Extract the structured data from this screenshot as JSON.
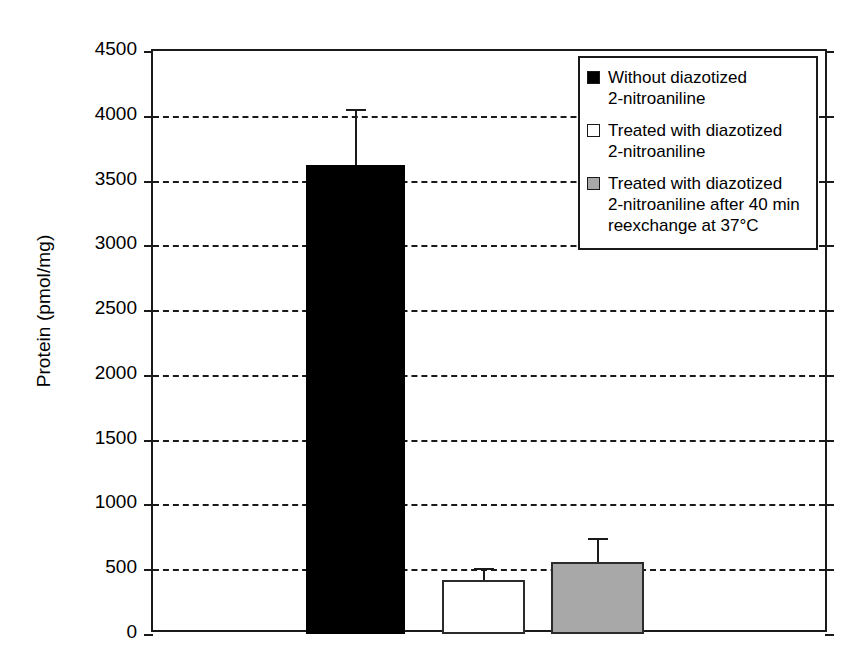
{
  "chart_data": {
    "type": "bar",
    "title": "",
    "xlabel": "",
    "ylabel": "Protein (pmol/mg)",
    "ylim": [
      0,
      4500
    ],
    "ytick_step": 500,
    "yticks": [
      0,
      500,
      1000,
      1500,
      2000,
      2500,
      3000,
      3500,
      4000,
      4500
    ],
    "ytick_labels": [
      "0",
      "500",
      "1000",
      "1500",
      "2000",
      "2500",
      "3000",
      "3500",
      "4000",
      "4500"
    ],
    "xtick_labels": [
      "",
      "",
      ""
    ],
    "grid": "horizontal-dashed",
    "legend_position": "top-right",
    "categories": [
      "Without diazotized 2-nitroaniline",
      "Treated with diazotized 2-nitroaniline",
      "Treated with diazotized 2-nitroaniline after 40 min reexchange at 37°C"
    ],
    "values": [
      3620,
      420,
      555
    ],
    "errors": [
      430,
      90,
      185
    ],
    "error_upper": [
      4050,
      510,
      740
    ],
    "bar_colors": [
      "#000000",
      "#ffffff",
      "#a8a8a8"
    ],
    "bar_edge_color": "#1a1a1a",
    "series": [
      {
        "name": "Protein (pmol/mg)",
        "values": [
          3620,
          420,
          555
        ],
        "errors": [
          430,
          90,
          185
        ]
      }
    ]
  },
  "axis": {
    "ylabel": "Protein (pmol/mg)"
  },
  "legend": {
    "items": [
      {
        "swatch": "black",
        "label": "Without diazotized\n2-nitroaniline"
      },
      {
        "swatch": "white",
        "label": "Treated with diazotized\n2-nitroaniline"
      },
      {
        "swatch": "gray",
        "label": "Treated with diazotized\n2-nitroaniline after 40 min\nreexchange at 37°C"
      }
    ]
  },
  "colors": {
    "axis": "#1a1a1a",
    "bar_black": "#000000",
    "bar_white": "#ffffff",
    "bar_gray": "#a8a8a8",
    "background": "#ffffff"
  }
}
